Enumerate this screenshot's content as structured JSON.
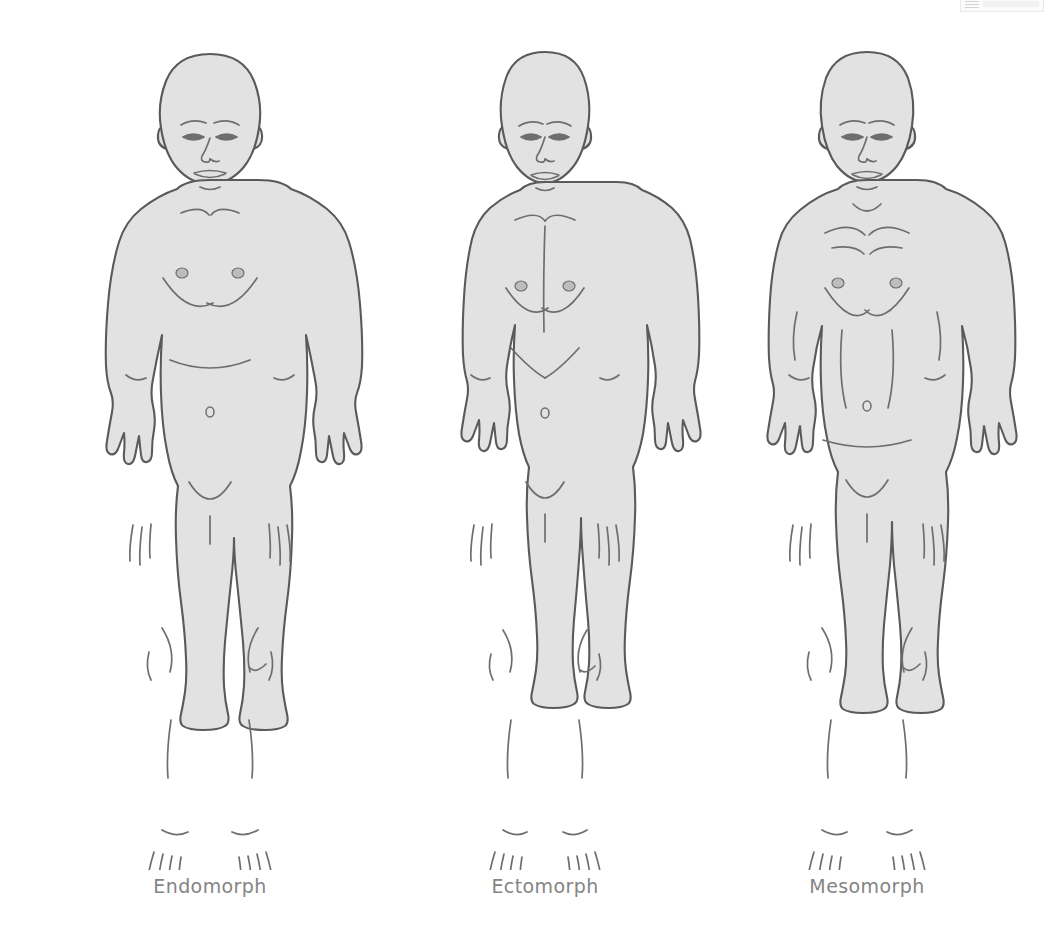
{
  "page": {
    "background_color": "#ffffff"
  },
  "style": {
    "body_fill": "#e2e2e2",
    "body_stroke": "#5a5a5a",
    "detail_stroke": "#6e6e6e",
    "label_color": "#848484",
    "label_font_size": "19px"
  },
  "top_fragment": {
    "name": "partial-ui-panel",
    "visible": true
  },
  "figures": [
    {
      "id": "endomorph",
      "label": "Endomorph",
      "build": "heavy, rounded, wide waist, thick limbs",
      "shoulder_width": "medium",
      "waist_width": "wide",
      "icon": "male-body-front-icon"
    },
    {
      "id": "ectomorph",
      "label": "Ectomorph",
      "build": "slim, narrow shoulders and hips, lean limbs",
      "shoulder_width": "narrow",
      "waist_width": "narrow",
      "icon": "male-body-front-icon"
    },
    {
      "id": "mesomorph",
      "label": "Mesomorph",
      "build": "muscular, broad shoulders, tapered waist",
      "shoulder_width": "broad",
      "waist_width": "medium",
      "icon": "male-body-front-icon"
    }
  ]
}
